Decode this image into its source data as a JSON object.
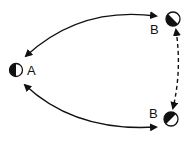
{
  "diagram": {
    "nodes": [
      {
        "id": "A",
        "label": "A",
        "shading": "left-half-dark"
      },
      {
        "id": "B_top",
        "label": "B",
        "shading": "diagonal-lower-left-dark"
      },
      {
        "id": "B_bottom",
        "label": "B",
        "shading": "diagonal-lower-left-dark"
      }
    ],
    "edges": [
      {
        "from": "A",
        "to": "B_top",
        "style": "solid",
        "arrows": "both"
      },
      {
        "from": "A",
        "to": "B_bottom",
        "style": "solid",
        "arrows": "both"
      },
      {
        "from": "B_top",
        "to": "B_bottom",
        "style": "dashed",
        "arrows": "both"
      }
    ],
    "colors": {
      "ink": "#111111",
      "background": "#ffffff"
    }
  }
}
